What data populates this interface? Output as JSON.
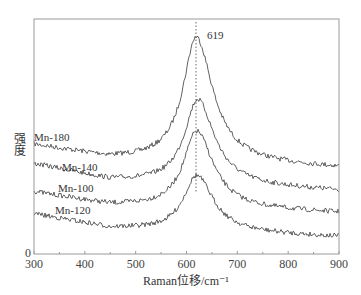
{
  "chart_data": {
    "type": "line",
    "title": "",
    "xlabel": "Raman位移/cm⁻¹",
    "ylabel": "强度",
    "xlim": [
      300,
      900
    ],
    "xticks": [
      300,
      400,
      500,
      600,
      700,
      800,
      900
    ],
    "yticks": [
      0
    ],
    "grid": false,
    "legend": "inline labels",
    "annotations": [
      {
        "text": "619",
        "x": 619,
        "note": "dotted vertical line marking peak position"
      }
    ],
    "series": [
      {
        "name": "Mn-180",
        "peak_x": 619,
        "peak_px_y": 33,
        "base_left_px_y": 145,
        "base_mid_px_y": 158,
        "base_right_px_y": 168,
        "label_px": [
          34,
          141
        ]
      },
      {
        "name": "Mn-140",
        "peak_x": 622,
        "peak_px_y": 95,
        "base_left_px_y": 164,
        "base_mid_px_y": 180,
        "base_right_px_y": 191,
        "label_px": [
          62,
          171
        ]
      },
      {
        "name": "Mn-100",
        "peak_x": 620,
        "peak_px_y": 128,
        "base_left_px_y": 192,
        "base_mid_px_y": 205,
        "base_right_px_y": 213,
        "label_px": [
          58,
          192
        ]
      },
      {
        "name": "Mn-120",
        "peak_x": 620,
        "peak_px_y": 172,
        "base_left_px_y": 214,
        "base_mid_px_y": 228,
        "base_right_px_y": 237,
        "label_px": [
          55,
          214
        ]
      }
    ]
  },
  "labels": {
    "xlabel": "Raman位移/cm⁻¹",
    "ylabel": "强度",
    "peak_annotation": "619",
    "y_zero": "0"
  },
  "colors": {
    "axis": "#9a9a9a",
    "curve": "#3a3a3a",
    "text": "#444444"
  }
}
